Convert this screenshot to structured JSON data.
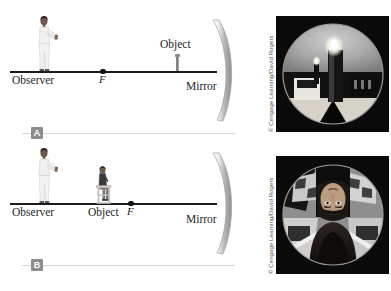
{
  "figure": {
    "background_color": "#ffffff"
  },
  "panels": [
    {
      "id": "A",
      "badge_label": "A",
      "labels": {
        "observer": "Observer",
        "object": "Object",
        "focal_point": "F",
        "mirror": "Mirror"
      },
      "description": "Observer far from mirror, object placed between focal point and mirror",
      "photo": {
        "caption_credit": "© Cengage Learning/David Rogers",
        "subject": "candle reflected upright and magnified in a concave mirror"
      }
    },
    {
      "id": "B",
      "badge_label": "B",
      "labels": {
        "observer": "Observer",
        "object": "Object",
        "focal_point": "F",
        "mirror": "Mirror"
      },
      "description": "Observer and seated object both beyond the focal point of the mirror",
      "photo": {
        "caption_credit": "© Cengage Learning/David Rogers",
        "subject": "person's face reflected inverted in a concave mirror"
      }
    }
  ],
  "colors": {
    "axis": "#1b1b1b",
    "badge_background": "#8d8d8d",
    "badge_text": "#ffffff",
    "rule": "#d8d8d8",
    "mirror_light": "#e8e8e8",
    "mirror_dark": "#9a9a9a",
    "label_text": "#1f1f1f"
  }
}
